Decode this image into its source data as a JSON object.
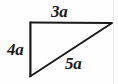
{
  "figure": {
    "type": "geometry-diagram",
    "shape": "right-triangle",
    "canvas": {
      "width": 118,
      "height": 84,
      "background": "#fefefe"
    },
    "stroke_color": "#1a1a1a",
    "stroke_width": 2,
    "right_angle_vertex": "top-left",
    "vertices": {
      "top_left": {
        "x": 30,
        "y": 22
      },
      "top_right": {
        "x": 112,
        "y": 23
      },
      "bottom_left": {
        "x": 30,
        "y": 76
      }
    },
    "sides": [
      {
        "name": "top-side",
        "label": "3a",
        "from": "top_left",
        "to": "top_right",
        "label_position": "above"
      },
      {
        "name": "left-side",
        "label": "4a",
        "from": "top_left",
        "to": "bottom_left",
        "label_position": "left"
      },
      {
        "name": "hypotenuse",
        "label": "5a",
        "from": "bottom_left",
        "to": "top_right",
        "label_position": "below-right"
      }
    ],
    "labels": {
      "top": "3a",
      "left": "4a",
      "hypotenuse": "5a"
    }
  }
}
